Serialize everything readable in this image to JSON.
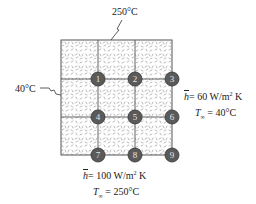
{
  "diagram": {
    "type": "2D finite-difference grid (3x3 cells, 9 nodes)",
    "top_boundary": {
      "label": "250°C"
    },
    "left_boundary": {
      "label": "40°C"
    },
    "right_boundary": {
      "h_symbol": "h",
      "h_value": "= 60 W/m",
      "h_exp": "2",
      "h_unit": " K",
      "tinf_symbol": "T",
      "tinf_sub": "∞",
      "tinf_value": " = 40°C"
    },
    "bottom_boundary": {
      "h_symbol": "h",
      "h_value": "= 100 W/m",
      "h_exp": "2",
      "h_unit": " K",
      "tinf_symbol": "T",
      "tinf_sub": "∞",
      "tinf_value": " = 250°C"
    },
    "nodes": [
      {
        "id": "1",
        "x": 98,
        "y": 79
      },
      {
        "id": "2",
        "x": 135,
        "y": 79
      },
      {
        "id": "3",
        "x": 172,
        "y": 79
      },
      {
        "id": "4",
        "x": 98,
        "y": 117
      },
      {
        "id": "5",
        "x": 135,
        "y": 117
      },
      {
        "id": "6",
        "x": 172,
        "y": 117
      },
      {
        "id": "7",
        "x": 98,
        "y": 155
      },
      {
        "id": "8",
        "x": 135,
        "y": 155
      },
      {
        "id": "9",
        "x": 172,
        "y": 155
      }
    ],
    "colors": {
      "node_fill": "#5a5a5a",
      "node_stroke": "#333333",
      "node_text": "#e6e6e6",
      "grid_line": "#555555",
      "hatch": "#9a9a9a"
    }
  }
}
